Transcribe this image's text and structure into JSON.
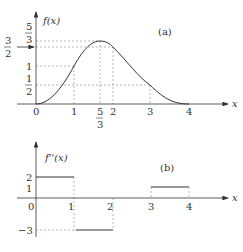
{
  "figure": {
    "panel_a": {
      "label": "(a)",
      "y_axis_label": "f(x)",
      "x_axis_label": "x",
      "x_ticks": [
        "0",
        "1",
        "5",
        "3",
        "2",
        "3",
        "4"
      ],
      "x_tick_values": [
        {
          "label": "0"
        },
        {
          "label": "1"
        },
        {
          "num": "5",
          "den": "3"
        },
        {
          "label": "2"
        },
        {
          "label": "3"
        },
        {
          "label": "4"
        }
      ],
      "y_ticks": [
        {
          "num": "1",
          "den": "2"
        },
        {
          "label": "1"
        },
        {
          "num": "3",
          "den": "2"
        },
        {
          "num": "5",
          "den": "3"
        }
      ],
      "tick_1_half_num": "1",
      "tick_1_half_den": "2",
      "tick_1": "1",
      "tick_3_half_num": "3",
      "tick_3_half_den": "2",
      "tick_5_third_num": "5",
      "tick_5_third_den": "3",
      "x0": "0",
      "x1": "1",
      "x53_num": "5",
      "x53_den": "3",
      "x2": "2",
      "x3": "3",
      "x4": "4"
    },
    "panel_b": {
      "label": "(b)",
      "y_axis_label": "f''(x)",
      "x_axis_label": "x",
      "y2": "2",
      "y1": "1",
      "ym3": "−3",
      "x0": "0",
      "x1": "1",
      "x2": "2",
      "x3": "3",
      "x4": "4",
      "segments": [
        {
          "x_from": 0,
          "x_to": 1,
          "y": 2
        },
        {
          "x_from": 1,
          "x_to": 2,
          "y": -3
        },
        {
          "x_from": 3,
          "x_to": 4,
          "y": 1
        }
      ]
    }
  }
}
